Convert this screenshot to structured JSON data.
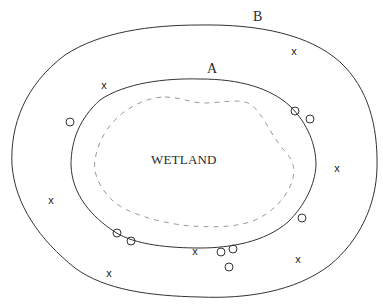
{
  "diagram": {
    "labels": {
      "outer_boundary": "B",
      "inner_boundary": "A",
      "center": "WETLAND"
    },
    "boundaries": [
      {
        "name": "B",
        "style": "solid",
        "description": "outer boundary"
      },
      {
        "name": "A",
        "style": "solid",
        "description": "inner boundary"
      },
      {
        "name": "wetland-edge",
        "style": "dashed",
        "description": "wetland edge"
      }
    ],
    "markers": {
      "x_symbol": "x",
      "o_symbol": "o",
      "x_points": [
        {
          "x": 104,
          "y": 85
        },
        {
          "x": 294,
          "y": 51
        },
        {
          "x": 51,
          "y": 200
        },
        {
          "x": 337,
          "y": 168
        },
        {
          "x": 195,
          "y": 251
        },
        {
          "x": 109,
          "y": 273
        },
        {
          "x": 298,
          "y": 259
        }
      ],
      "o_points": [
        {
          "x": 70,
          "y": 122
        },
        {
          "x": 295,
          "y": 111
        },
        {
          "x": 310,
          "y": 119
        },
        {
          "x": 117,
          "y": 233
        },
        {
          "x": 131,
          "y": 241
        },
        {
          "x": 302,
          "y": 218
        },
        {
          "x": 221,
          "y": 252
        },
        {
          "x": 233,
          "y": 249
        },
        {
          "x": 229,
          "y": 267
        }
      ]
    },
    "colors": {
      "line": "#333333",
      "dashed": "#999999",
      "background": "#ffffff"
    }
  }
}
